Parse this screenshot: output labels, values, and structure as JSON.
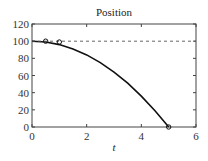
{
  "chart_data": {
    "type": "line",
    "title": "Position",
    "xlabel": "t",
    "ylabel": "",
    "xlim": [
      0,
      6
    ],
    "ylim": [
      0,
      120
    ],
    "xticks": [
      0,
      2,
      4,
      6
    ],
    "yticks": [
      0,
      20,
      40,
      60,
      80,
      100,
      120
    ],
    "grid": false,
    "legend": null,
    "series": [
      {
        "name": "position",
        "style": "solid",
        "x": [
          0,
          0.5,
          1,
          1.5,
          2,
          2.5,
          3,
          3.5,
          4,
          4.5,
          5
        ],
        "y": [
          100,
          99,
          96,
          91,
          84,
          75,
          64,
          51,
          36,
          19,
          0
        ]
      },
      {
        "name": "reference",
        "style": "dashed",
        "x": [
          0,
          6
        ],
        "y": [
          100,
          100
        ]
      }
    ],
    "markers": [
      {
        "x": 0.5,
        "y": 100
      },
      {
        "x": 1,
        "y": 99
      },
      {
        "x": 5,
        "y": 0
      }
    ]
  }
}
